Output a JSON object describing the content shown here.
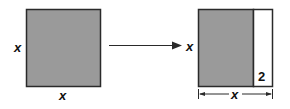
{
  "diagram": {
    "colors": {
      "fill": "#9a9a9a",
      "stroke": "#2a2a2a",
      "background": "#ffffff",
      "strip": "#ffffff"
    },
    "left_square": {
      "side_label": "x",
      "bottom_label": "x"
    },
    "arrow": {
      "direction": "right"
    },
    "right_rectangle": {
      "side_label": "x",
      "strip_label": "2",
      "width_label": "x"
    }
  }
}
